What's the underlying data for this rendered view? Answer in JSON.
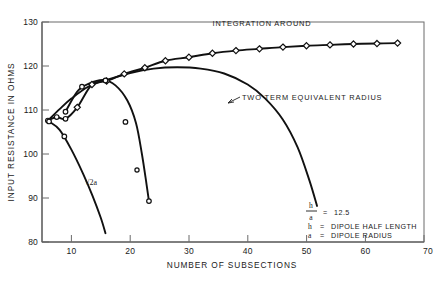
{
  "chart_data": {
    "type": "line",
    "title": "",
    "xlabel": "NUMBER OF SUBSECTIONS",
    "ylabel": "INPUT RESISTANCE IN OHMS",
    "xlim": [
      5,
      70
    ],
    "ylim": [
      80,
      130
    ],
    "xticks": [
      10,
      20,
      30,
      40,
      50,
      60,
      70
    ],
    "yticks": [
      80,
      90,
      100,
      110,
      120,
      130
    ],
    "xtick_labels": [
      "10",
      "20",
      "30",
      "40",
      "50",
      "60",
      "70"
    ],
    "ytick_labels": [
      "80",
      "90",
      "100",
      "110",
      "120",
      "130"
    ],
    "grid": false,
    "legend_position": "inside-bottom-right",
    "series": [
      {
        "name": "INTEGRATION AROUND",
        "marker": "diamond",
        "points": [
          [
            6.0,
            107.6
          ],
          [
            7.5,
            108.4
          ],
          [
            9.0,
            108.0
          ],
          [
            11.0,
            110.6
          ],
          [
            13.5,
            115.8
          ],
          [
            16.0,
            116.6
          ],
          [
            19.0,
            118.2
          ],
          [
            22.5,
            119.6
          ],
          [
            26.0,
            121.2
          ],
          [
            30.0,
            122.0
          ],
          [
            34.0,
            122.9
          ],
          [
            38.0,
            123.5
          ],
          [
            42.0,
            123.9
          ],
          [
            46.0,
            124.3
          ],
          [
            50.0,
            124.6
          ],
          [
            54.0,
            124.8
          ],
          [
            58.0,
            125.0
          ],
          [
            62.0,
            125.1
          ],
          [
            65.5,
            125.2
          ]
        ]
      },
      {
        "name": "TWO TERM EQUIVALENT RADIUS",
        "marker": "none",
        "points": [
          [
            6.0,
            107.6
          ],
          [
            8.0,
            110.2
          ],
          [
            10.0,
            112.6
          ],
          [
            13.0,
            115.4
          ],
          [
            16.0,
            116.8
          ],
          [
            20.0,
            118.4
          ],
          [
            24.0,
            119.4
          ],
          [
            28.0,
            119.7
          ],
          [
            32.0,
            119.4
          ],
          [
            36.0,
            118.3
          ],
          [
            40.0,
            115.8
          ],
          [
            43.0,
            112.6
          ],
          [
            46.0,
            107.8
          ],
          [
            48.5,
            101.5
          ],
          [
            50.5,
            94.0
          ],
          [
            51.8,
            88.2
          ]
        ]
      },
      {
        "name": "sqrt2a-curve",
        "marker": "circle",
        "points": [
          [
            6.2,
            107.4
          ],
          [
            8.0,
            105.5
          ],
          [
            10.0,
            101.0
          ],
          [
            12.0,
            95.5
          ],
          [
            13.6,
            90.5
          ],
          [
            15.0,
            85.5
          ],
          [
            15.8,
            82.0
          ]
        ],
        "marker_points": [
          [
            6.2,
            107.4
          ],
          [
            8.8,
            104.0
          ]
        ]
      },
      {
        "name": "mid-descending-curve",
        "marker": "circle",
        "points": [
          [
            9.0,
            109.6
          ],
          [
            11.0,
            114.2
          ],
          [
            13.0,
            116.0
          ],
          [
            15.5,
            116.8
          ],
          [
            17.5,
            115.6
          ],
          [
            19.5,
            112.2
          ],
          [
            21.0,
            107.0
          ],
          [
            22.0,
            100.0
          ],
          [
            22.8,
            93.0
          ],
          [
            23.2,
            89.3
          ]
        ],
        "marker_points": [
          [
            9.0,
            109.6
          ],
          [
            11.8,
            115.3
          ],
          [
            15.8,
            116.7
          ],
          [
            19.2,
            107.3
          ],
          [
            23.2,
            89.3
          ]
        ]
      }
    ],
    "annotations": [
      {
        "id": "integration-around-label",
        "text": "INTEGRATION AROUND",
        "x": 37.5,
        "y": 128.4
      },
      {
        "id": "two-term-label",
        "text": "TWO TERM EQUIVALENT RADIUS",
        "x": 36.5,
        "y": 114.0
      },
      {
        "id": "sqrt2a-label",
        "text": "√2a",
        "x": 11.0,
        "y": 96.3
      }
    ],
    "legend": {
      "ratio_numerator": "h",
      "ratio_denominator": "a",
      "ratio_equals": "=",
      "ratio_value": "12.5",
      "rows": [
        {
          "symbol": "h",
          "equals": "=",
          "text": "DIPOLE  HALF LENGTH"
        },
        {
          "symbol": "a",
          "equals": "=",
          "text": "DIPOLE RADIUS"
        }
      ]
    }
  },
  "figure": {
    "caption": "",
    "colors": {
      "curve": "#111111",
      "frame": "#6b6b6b",
      "background": "#ffffff"
    }
  }
}
